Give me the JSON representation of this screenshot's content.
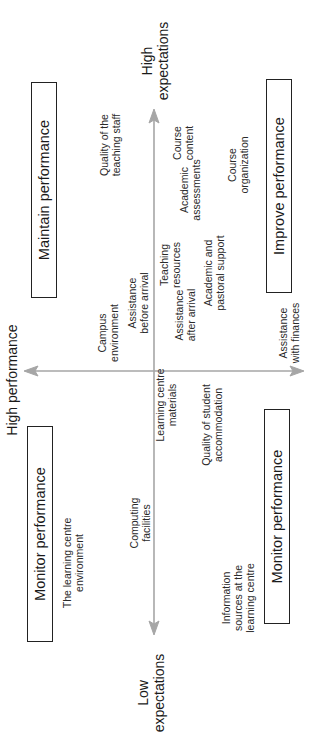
{
  "diagram": {
    "title": "High performance",
    "axes": {
      "vertical_top": "High\nexpectations",
      "vertical_bottom": "Low\nexpectations",
      "color": "#a6a6a6"
    },
    "quadrants": {
      "top_left": "Maintain performance",
      "top_right": "Improve performance",
      "bottom_left": "Monitor performance",
      "bottom_right": "Monitor performance"
    },
    "items": [
      {
        "label": "Quality of the\nteaching staff",
        "x": 586,
        "y": 110
      },
      {
        "label": "Course\ncontent",
        "x": 588,
        "y": 183
      },
      {
        "label": "Academic\nassessments",
        "x": 541,
        "y": 190
      },
      {
        "label": "Course\norganization",
        "x": 566,
        "y": 238
      },
      {
        "label": "Teaching\nresources",
        "x": 466,
        "y": 170
      },
      {
        "label": "Academic and\npastoral support",
        "x": 458,
        "y": 214
      },
      {
        "label": "Campus\nenvironment",
        "x": 398,
        "y": 108
      },
      {
        "label": "Assistance\nbefore arrival",
        "x": 428,
        "y": 138
      },
      {
        "label": "Assistance\nafter arrival",
        "x": 416,
        "y": 185
      },
      {
        "label": "Assistance\nwith finances",
        "x": 398,
        "y": 289
      },
      {
        "label": "Learning centre\nmaterials",
        "x": 326,
        "y": 166
      },
      {
        "label": "Quality of student\naccommodation",
        "x": 306,
        "y": 212
      },
      {
        "label": "Computing\nfacilities",
        "x": 208,
        "y": 140
      },
      {
        "label": "The learning centre\nenvironment",
        "x": 168,
        "y": 73
      },
      {
        "label": "Information\nsources at the\nlearning centre",
        "x": 133,
        "y": 238
      }
    ]
  }
}
